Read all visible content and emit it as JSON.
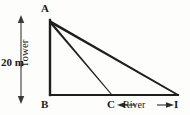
{
  "figure": {
    "name": "tower-and-river-geometry-diagram",
    "background_color": "#fdfdfc",
    "line_color": "#1f1f1f",
    "text_color": "#1a1a1a",
    "vertices": {
      "A": {
        "label": "A",
        "x": 50,
        "y": 20,
        "role": "tower-top"
      },
      "B": {
        "label": "B",
        "x": 50,
        "y": 95,
        "role": "tower-base"
      },
      "C": {
        "label": "C",
        "x": 112,
        "y": 95,
        "role": "river-near-bank"
      },
      "I": {
        "label": "I",
        "x": 178,
        "y": 95,
        "role": "river-far-bank"
      }
    },
    "segments": [
      {
        "name": "tower-AB",
        "from": "A",
        "to": "B"
      },
      {
        "name": "line-of-sight-AC",
        "from": "A",
        "to": "C"
      },
      {
        "name": "line-of-sight-AI",
        "from": "A",
        "to": "I"
      },
      {
        "name": "ground-BI",
        "from": "B",
        "to": "I"
      }
    ],
    "labels": {
      "tower": "Tower",
      "height": "20 m",
      "river": "River"
    },
    "dimension": {
      "name": "tower-height-dimension",
      "value": "20 m",
      "x": 21,
      "y_top": 16,
      "y_bottom": 103,
      "arrows": "both"
    },
    "river_span": {
      "name": "river-width-dimension",
      "value": "River",
      "y": 105,
      "x_left": 117,
      "x_right": 173,
      "arrows": "both"
    }
  }
}
